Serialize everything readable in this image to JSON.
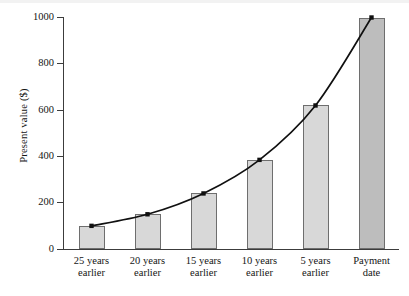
{
  "chart_data": {
    "type": "bar",
    "title": "",
    "xlabel": "",
    "ylabel": "Present value ($)",
    "categories": [
      "25 years earlier",
      "20 years earlier",
      "15 years earlier",
      "10 years earlier",
      "5 years earlier",
      "Payment date"
    ],
    "category_lines": [
      [
        "25 years",
        "earlier"
      ],
      [
        "20 years",
        "earlier"
      ],
      [
        "15 years",
        "earlier"
      ],
      [
        "10 years",
        "earlier"
      ],
      [
        "5 years",
        "earlier"
      ],
      [
        "Payment",
        "date"
      ]
    ],
    "values": [
      100,
      150,
      240,
      385,
      620,
      1000
    ],
    "ylim": [
      0,
      1000
    ],
    "yticks": [
      0,
      200,
      400,
      600,
      800,
      1000
    ],
    "ytick_labels": [
      "0",
      "200",
      "400",
      "600",
      "800",
      "1000"
    ],
    "grid": false,
    "legend": null,
    "overlay_series": {
      "name": "present value curve",
      "type": "line",
      "values": [
        100,
        150,
        240,
        385,
        620,
        1000
      ],
      "markers": true
    },
    "colors": {
      "bar_fill": "#d8d8d8",
      "bar_fill_highlight": "#bdbdbd",
      "bar_stroke": "#6e6e6e",
      "curve": "#101010",
      "axis": "#3c3c3c",
      "text": "#141414",
      "background": "#ffffff"
    }
  }
}
